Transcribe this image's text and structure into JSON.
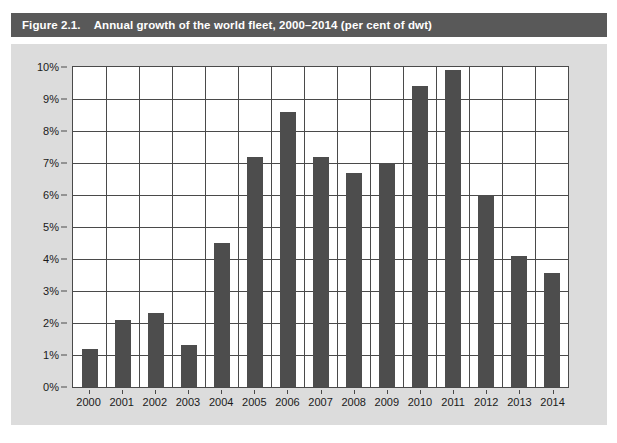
{
  "figure": {
    "number_label": "Figure 2.1.",
    "caption": "Annual growth of the world fleet, 2000–2014 (per cent of dwt)",
    "title_bar_color": "#595959",
    "title_text_color": "#ffffff",
    "panel_background": "#dcdcdc",
    "plot_background": "#ffffff",
    "bar_color": "#4d4d4d",
    "grid_color": "#4a4a4a"
  },
  "chart_data": {
    "type": "bar",
    "title": "Annual growth of the world fleet, 2000–2014 (per cent of dwt)",
    "xlabel": "",
    "ylabel": "",
    "categories": [
      "2000",
      "2001",
      "2002",
      "2003",
      "2004",
      "2005",
      "2006",
      "2007",
      "2008",
      "2009",
      "2010",
      "2011",
      "2012",
      "2013",
      "2014"
    ],
    "values": [
      1.2,
      2.1,
      2.3,
      1.3,
      4.5,
      7.2,
      8.6,
      7.2,
      6.7,
      7.0,
      9.4,
      9.9,
      6.0,
      4.1,
      3.55
    ],
    "value_labels": [
      "1.2%",
      "2.1%",
      "2.3%",
      "1.3%",
      "4.5%",
      "7.2%",
      "8.6%",
      "7.2%",
      "6.7%",
      "7.0%",
      "9.4%",
      "9.9%",
      "6.0%",
      "4.1%",
      "3.6%"
    ],
    "ylim": [
      0,
      10
    ],
    "ytick_values": [
      0,
      1,
      2,
      3,
      4,
      5,
      6,
      7,
      8,
      9,
      10
    ],
    "ytick_labels": [
      "0%",
      "1%",
      "2%",
      "3%",
      "4%",
      "5%",
      "6%",
      "7%",
      "8%",
      "9%",
      "10%"
    ],
    "grid": "both",
    "legend": "none",
    "series_name": "Annual growth of world fleet"
  }
}
